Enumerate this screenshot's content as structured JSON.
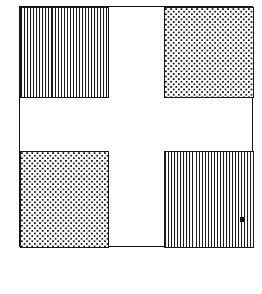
{
  "figure": {
    "background_color": "#ffffff",
    "frame": {
      "name": "outer square frame",
      "border_color": "#121212",
      "border_width_px": 1,
      "x": 19,
      "y": 6,
      "width": 234,
      "height": 241
    },
    "center_gap": {
      "name": "white cross separator",
      "color": "#ffffff",
      "horizontal_band_height_px": 53,
      "vertical_band_width_px": 55
    },
    "quadrants": [
      {
        "id": "top-left",
        "position": "top-left",
        "fill": "vertical-lines",
        "fill_label": "vertical line hatching",
        "line_color": "#1c1c1c",
        "line_spacing_px": 3,
        "border_color": "#1a1a1a",
        "x": 0,
        "y": 0,
        "width": 89,
        "height": 91
      },
      {
        "id": "top-right",
        "position": "top-right",
        "fill": "dots",
        "fill_label": "dotted stipple",
        "dot_color": "#151515",
        "dot_spacing_px": 5,
        "border_color": "#1a1a1a",
        "x": 144,
        "y": 0,
        "width": 90,
        "height": 91
      },
      {
        "id": "bottom-left",
        "position": "bottom-left",
        "fill": "dots",
        "fill_label": "dotted stipple",
        "dot_color": "#151515",
        "dot_spacing_px": 5,
        "border_color": "#1a1a1a",
        "x": 0,
        "y": 144,
        "width": 89,
        "height": 97
      },
      {
        "id": "bottom-right",
        "position": "bottom-right",
        "fill": "vertical-lines",
        "fill_label": "vertical line hatching",
        "line_color": "#1c1c1c",
        "line_spacing_px": 3,
        "border_color": "#1a1a1a",
        "x": 144,
        "y": 144,
        "width": 90,
        "height": 97
      }
    ],
    "marks": [
      {
        "id": "artifact-mark",
        "label": "small dark square mark",
        "color": "#111111",
        "x": 240,
        "y": 217,
        "width": 4,
        "height": 5,
        "inside_quadrant": "bottom-right"
      }
    ]
  }
}
